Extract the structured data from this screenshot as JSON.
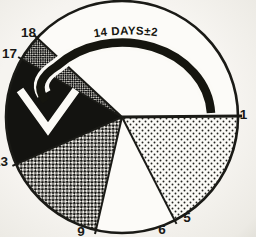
{
  "figure": {
    "arrow_label": "14 DAYS±2",
    "days": [
      "1",
      "5",
      "6",
      "9",
      "13",
      "17",
      "18"
    ],
    "colors": {
      "ink": "#1a1a16",
      "paper": "#f4f2ee",
      "circle_fill": "#fcfbf8",
      "solid_sector": "#131310"
    },
    "sectors": [
      {
        "days": "1-5",
        "fill": "light-stipple"
      },
      {
        "days": "6-9",
        "fill": "white"
      },
      {
        "days": "9-13",
        "fill": "checker"
      },
      {
        "days": "13-17",
        "fill": "solid-black"
      },
      {
        "days": "17-18",
        "fill": "dark-checker"
      },
      {
        "days": "18-1",
        "fill": "white"
      }
    ]
  }
}
